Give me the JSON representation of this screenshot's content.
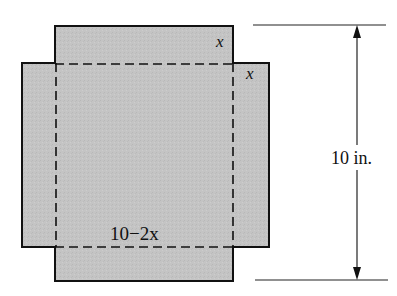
{
  "diagram": {
    "type": "cross-shaped sheet with cut corners (open box net)",
    "fill_color": "#c2c2c2",
    "stroke_color": "#111111",
    "background": "#ffffff",
    "labels": {
      "corner_x_top": "x",
      "corner_x_right": "x",
      "base_side": "10−2x",
      "dimension": "10 in."
    },
    "shapes": {
      "vertical_arm": {
        "x1": 55,
        "y1": 26,
        "x2": 233,
        "y2": 281
      },
      "horizontal_arm": {
        "x1": 22,
        "y1": 63,
        "x2": 269,
        "y2": 247
      },
      "fold_lines": {
        "left_x": 56,
        "right_x": 233,
        "top_y": 64,
        "bottom_y": 247
      }
    },
    "dimension_line": {
      "x": 357,
      "top_y": 25,
      "bottom_y": 280,
      "top_extension": {
        "x1": 253,
        "x2": 386
      },
      "bottom_extension": {
        "x1": 255,
        "x2": 388
      }
    }
  }
}
